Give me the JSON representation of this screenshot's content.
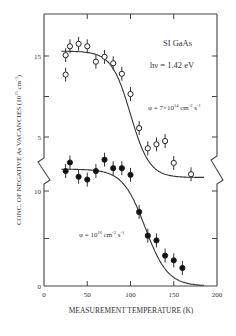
{
  "chart_data": {
    "type": "scatter",
    "title": "",
    "xlabel": "MEASUREMENT TEMPERATURE (K)",
    "ylabel": "CONC. OF NEGATIVE As VACANCIES (10^15 cm^-3)",
    "ylabel_main": "CONC. OF NEGATIVE As VACANCIES (10",
    "ylabel_exp": "15",
    "ylabel_unit": " cm",
    "ylabel_unit_exp": "-3",
    "ylabel_close": ")",
    "xlim": [
      0,
      200
    ],
    "xticks": [
      0,
      50,
      100,
      150,
      200
    ],
    "xtick_labels": [
      "0",
      "50",
      "100",
      "150",
      "200"
    ],
    "axis_break": true,
    "upper_panel": {
      "yticks": [
        5,
        15
      ],
      "ytick_labels": [
        "5",
        "15"
      ],
      "minor_yticks": [
        10
      ]
    },
    "lower_panel": {
      "yticks": [
        0,
        10
      ],
      "ytick_labels": [
        "0",
        "10"
      ],
      "minor_yticks": [
        5
      ]
    },
    "annotations": {
      "sample": "SI GaAs",
      "photon_energy": "hν = 1.42 eV",
      "flux_open_prefix": "φ = 7×10",
      "flux_open_exp": "14",
      "flux_open_unit": " cm",
      "flux_open_unit_exp1": "-2",
      "flux_open_s": " s",
      "flux_open_unit_exp2": "-1",
      "flux_filled_prefix": "φ = 10",
      "flux_filled_exp": "16",
      "flux_filled_unit": " cm",
      "flux_filled_unit_exp1": "-2",
      "flux_filled_s": " s",
      "flux_filled_unit_exp2": "-1"
    },
    "series": [
      {
        "name": "φ = 7×10^14 cm^-2 s^-1",
        "marker": "open-circle",
        "panel": "upper",
        "x": [
          25,
          25,
          30,
          40,
          50,
          60,
          70,
          80,
          90,
          100,
          110,
          120,
          130,
          140,
          150,
          170
        ],
        "y": [
          15.1,
          12.7,
          16.2,
          16.5,
          16.2,
          14.3,
          14.9,
          14.1,
          12.8,
          10.3,
          6.1,
          3.6,
          4.1,
          4.5,
          1.8,
          0.4
        ],
        "fit": {
          "plateau": 15.6,
          "midpoint": 100,
          "width": 11,
          "floor": 0.0
        }
      },
      {
        "name": "φ = 10^16 cm^-2 s^-1",
        "marker": "filled-circle",
        "panel": "lower",
        "x": [
          25,
          30,
          40,
          50,
          60,
          70,
          80,
          90,
          100,
          110,
          120,
          130,
          140,
          150,
          160
        ],
        "y": [
          12.1,
          13.0,
          11.5,
          11.2,
          12.1,
          13.3,
          12.4,
          12.4,
          11.7,
          7.8,
          5.3,
          4.8,
          3.2,
          2.7,
          1.9
        ],
        "fit": {
          "plateau": 12.3,
          "midpoint": 117,
          "width": 13,
          "floor": 0.0
        }
      }
    ],
    "legend": "none",
    "grid": false
  }
}
